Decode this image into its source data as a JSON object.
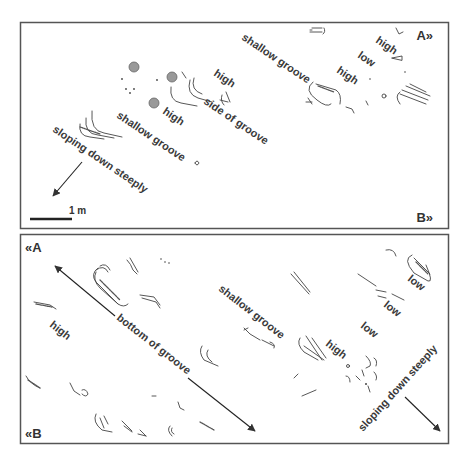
{
  "panel_top": {
    "corner_labels": {
      "top_right": "A»",
      "bottom_right": "B»"
    },
    "scale_bar": {
      "label": "1 m"
    },
    "labels": {
      "shallow_groove_1": "shallow groove",
      "shallow_groove_2": "shallow groove",
      "high_1": "high",
      "high_2": "high",
      "high_3": "high",
      "high_4": "high",
      "low_1": "low",
      "side_of_groove": "side of groove",
      "sloping": "sloping down steeply"
    }
  },
  "panel_bottom": {
    "corner_labels": {
      "top_left": "«A",
      "bottom_left": "«B"
    },
    "labels": {
      "bottom_of_groove": "bottom of groove",
      "shallow_groove": "shallow groove",
      "high_1": "high",
      "high_2": "high",
      "low_1": "low",
      "low_2": "low",
      "low_3": "low",
      "sloping": "sloping down steeply"
    }
  },
  "colors": {
    "border": "#555555",
    "ink": "#444444",
    "text": "#3a3a3a"
  }
}
